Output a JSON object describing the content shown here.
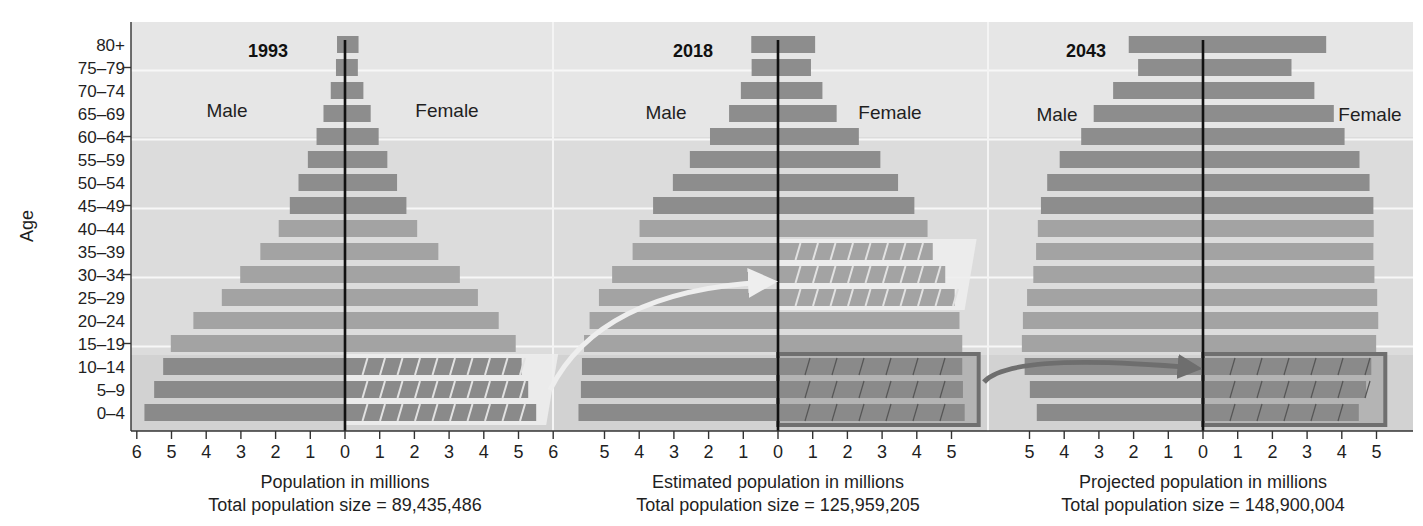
{
  "chart_data": {
    "type": "bar",
    "subtype": "population-pyramid",
    "ylabel": "Age",
    "categories": [
      "80+",
      "75–79",
      "70–74",
      "65–69",
      "60–64",
      "55–59",
      "50–54",
      "45–49",
      "40–44",
      "35–39",
      "30–34",
      "25–29",
      "20–24",
      "15–19",
      "10–14",
      "5–9",
      "0–4"
    ],
    "panels": [
      {
        "year": "1993",
        "left_label": "Male",
        "right_label": "Female",
        "xlabel": "Population in millions",
        "total_label": "Total population size = 89,435,486",
        "xticks": [
          6,
          5,
          4,
          3,
          2,
          1,
          0,
          1,
          2,
          3,
          4,
          5,
          6
        ],
        "xlim": [
          -6,
          6
        ],
        "series": [
          {
            "name": "Male",
            "values": [
              0.23,
              0.26,
              0.41,
              0.62,
              0.82,
              1.07,
              1.34,
              1.59,
              1.91,
              2.44,
              3.02,
              3.55,
              4.37,
              5.02,
              5.24,
              5.5,
              5.78
            ]
          },
          {
            "name": "Female",
            "values": [
              0.39,
              0.37,
              0.53,
              0.74,
              0.97,
              1.22,
              1.5,
              1.77,
              2.08,
              2.69,
              3.31,
              3.83,
              4.43,
              4.92,
              5.09,
              5.28,
              5.51
            ]
          }
        ],
        "highlight": {
          "ages": [
            "10–14",
            "5–9",
            "0–4"
          ],
          "side": "Female",
          "style": "light-box-with-grid"
        }
      },
      {
        "year": "2018",
        "left_label": "Male",
        "right_label": "Female",
        "xlabel": "Estimated population in millions",
        "total_label": "Total population size = 125,959,205",
        "xticks": [
          5,
          4,
          3,
          2,
          1,
          0,
          1,
          2,
          3,
          4,
          5
        ],
        "xlim": [
          -5.9,
          5.9
        ],
        "series": [
          {
            "name": "Male",
            "values": [
              0.77,
              0.76,
              1.07,
              1.41,
              1.96,
              2.54,
              3.03,
              3.6,
              3.99,
              4.19,
              4.78,
              5.16,
              5.43,
              5.59,
              5.65,
              5.68,
              5.75
            ]
          },
          {
            "name": "Female",
            "values": [
              1.07,
              0.95,
              1.28,
              1.69,
              2.33,
              2.95,
              3.46,
              3.93,
              4.31,
              4.46,
              4.82,
              5.09,
              5.23,
              5.31,
              5.31,
              5.33,
              5.38
            ]
          }
        ],
        "highlight": {
          "ages": [
            "35–39",
            "30–34",
            "25–29"
          ],
          "side": "Female",
          "style": "light-box-with-grid"
        },
        "highlight2": {
          "ages": [
            "10–14",
            "5–9",
            "0–4"
          ],
          "side": "Female",
          "style": "dark-outlined-hatched"
        }
      },
      {
        "year": "2043",
        "left_label": "Male",
        "right_label": "Female",
        "xlabel": "Projected population in millions",
        "total_label": "Total population size = 148,900,004",
        "xticks": [
          5,
          4,
          3,
          2,
          1,
          0,
          1,
          2,
          3,
          4,
          5
        ],
        "xlim": [
          -5.9,
          5.9
        ],
        "series": [
          {
            "name": "Male",
            "values": [
              2.14,
              1.87,
              2.59,
              3.15,
              3.51,
              4.13,
              4.49,
              4.67,
              4.76,
              4.81,
              4.89,
              5.07,
              5.19,
              5.22,
              5.14,
              4.99,
              4.79
            ]
          },
          {
            "name": "Female",
            "values": [
              3.55,
              2.55,
              3.21,
              3.77,
              4.08,
              4.51,
              4.8,
              4.91,
              4.92,
              4.91,
              4.94,
              5.02,
              5.05,
              4.99,
              4.85,
              4.7,
              4.49
            ]
          }
        ],
        "highlight": {
          "ages": [
            "10–14",
            "5–9",
            "0–4"
          ],
          "side": "Female",
          "style": "dark-outlined-hatched"
        }
      }
    ],
    "annotations": [
      {
        "type": "arrow",
        "from": "1993 Female 0–14 box",
        "to": "2018 Female 25–39",
        "color": "#eeeeee"
      },
      {
        "type": "arrow",
        "from": "2018 Female 0–14 box",
        "to": "2043 Female 0–14",
        "color": "#6e6e6e"
      }
    ],
    "grid": true,
    "legend": "none"
  },
  "colors": {
    "bar_old": "#8d8d8d",
    "bar_mid": "#a3a3a3",
    "bar_young": "#8a8a8a",
    "background": "#dcdcdc",
    "gridline": "#f7f7f7",
    "axis": "#333333"
  }
}
